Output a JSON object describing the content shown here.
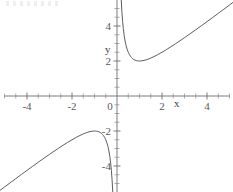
{
  "figure": {
    "background_color": "#ffffff",
    "curve_color": "#5c5c62",
    "axis_color": "#6e6e74",
    "label_color": "#58585c",
    "x_axis_name": "x",
    "y_axis_name": "y",
    "artifact_note": ""
  },
  "chart_data": {
    "type": "line",
    "title": "",
    "subtitle": "",
    "xlabel": "x",
    "ylabel": "y",
    "xlim": [
      -5.2,
      5.2
    ],
    "ylim": [
      -5.5,
      5.5
    ],
    "grid": false,
    "legend": false,
    "legend_position": "none",
    "function": "y = x + 1/x",
    "asymptotes": {
      "vertical": [
        0
      ],
      "oblique": [
        "y = x"
      ]
    },
    "x_ticks_major": [
      -4,
      -2,
      0,
      2,
      4
    ],
    "x_tick_labels": [
      "-4",
      "-2",
      "0",
      "2",
      "4"
    ],
    "y_ticks_major": [
      -4,
      -2,
      2,
      4
    ],
    "y_tick_labels": [
      "-4",
      "-2",
      "2",
      "4"
    ],
    "minor_tick_step": 0.5,
    "annotations": [
      {
        "text": "x",
        "x": 2.55,
        "y": -0.62
      },
      {
        "text": "y",
        "x": -0.52,
        "y": 2.52
      }
    ],
    "series": [
      {
        "name": "right branch (x > 0)",
        "x": [
          0.185,
          0.2,
          0.22,
          0.25,
          0.28,
          0.32,
          0.36,
          0.4,
          0.45,
          0.5,
          0.55,
          0.6,
          0.65,
          0.7,
          0.75,
          0.8,
          0.85,
          0.9,
          0.95,
          1.0,
          1.1,
          1.2,
          1.3,
          1.4,
          1.5,
          1.6,
          1.8,
          2.0,
          2.2,
          2.4,
          2.6,
          2.8,
          3.0,
          3.25,
          3.5,
          3.75,
          4.0,
          4.25,
          4.5,
          4.75,
          5.0,
          5.2
        ],
        "y": [
          5.59,
          5.2,
          4.77,
          4.25,
          3.85,
          3.445,
          3.138,
          2.9,
          2.672,
          2.5,
          2.368,
          2.267,
          2.188,
          2.129,
          2.083,
          2.05,
          2.027,
          2.011,
          2.003,
          2.0,
          2.009,
          2.033,
          2.069,
          2.114,
          2.167,
          2.225,
          2.356,
          2.5,
          2.655,
          2.817,
          2.985,
          3.157,
          3.333,
          3.558,
          3.786,
          4.017,
          4.25,
          4.485,
          4.722,
          4.961,
          5.2,
          5.392
        ],
        "min_point": {
          "x": 1,
          "y": 2
        }
      },
      {
        "name": "left branch (x < 0)",
        "x": [
          -5.2,
          -5.0,
          -4.75,
          -4.5,
          -4.25,
          -4.0,
          -3.75,
          -3.5,
          -3.25,
          -3.0,
          -2.8,
          -2.6,
          -2.4,
          -2.2,
          -2.0,
          -1.8,
          -1.6,
          -1.5,
          -1.4,
          -1.3,
          -1.2,
          -1.1,
          -1.0,
          -0.95,
          -0.9,
          -0.85,
          -0.8,
          -0.75,
          -0.7,
          -0.65,
          -0.6,
          -0.55,
          -0.5,
          -0.45,
          -0.4,
          -0.36,
          -0.32,
          -0.28,
          -0.25,
          -0.22,
          -0.2,
          -0.185
        ],
        "y": [
          -5.392,
          -5.2,
          -4.961,
          -4.722,
          -4.485,
          -4.25,
          -4.017,
          -3.786,
          -3.558,
          -3.333,
          -3.157,
          -2.985,
          -2.817,
          -2.655,
          -2.5,
          -2.356,
          -2.225,
          -2.167,
          -2.114,
          -2.069,
          -2.033,
          -2.009,
          -2.0,
          -2.003,
          -2.011,
          -2.027,
          -2.05,
          -2.083,
          -2.129,
          -2.188,
          -2.267,
          -2.368,
          -2.5,
          -2.672,
          -2.9,
          -3.138,
          -3.445,
          -3.85,
          -4.25,
          -4.77,
          -5.2,
          -5.59
        ],
        "max_point": {
          "x": -1,
          "y": -2
        }
      }
    ]
  }
}
